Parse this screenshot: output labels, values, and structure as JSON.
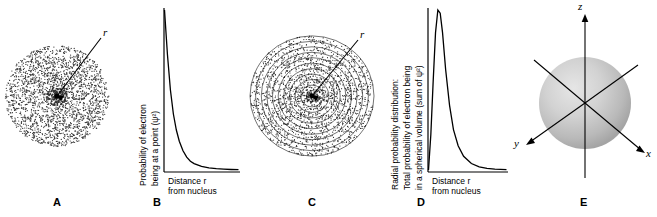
{
  "figure": {
    "panels": [
      {
        "id": "A",
        "letter": "A",
        "type": "electron-cloud-dot-density",
        "annotations": {
          "radius_label": "r"
        }
      },
      {
        "id": "B",
        "letter": "B",
        "type": "decay-curve-plot",
        "axes": {
          "ylabel_lines": [
            "Probability of electron",
            "being at a point (ψ²)"
          ],
          "xlabel_lines": [
            "Distance r",
            "from nucleus"
          ]
        },
        "chart": {
          "type": "line",
          "x": [
            0,
            0.04,
            0.08,
            0.12,
            0.16,
            0.2,
            0.25,
            0.3,
            0.35,
            0.4,
            0.5,
            0.6,
            0.7,
            0.8,
            0.9,
            1.0
          ],
          "y": [
            1.0,
            0.72,
            0.5,
            0.35,
            0.25,
            0.18,
            0.12,
            0.08,
            0.055,
            0.04,
            0.022,
            0.013,
            0.008,
            0.005,
            0.003,
            0.002
          ]
        }
      },
      {
        "id": "C",
        "letter": "C",
        "type": "concentric-shells-dot-density",
        "annotations": {
          "radius_label": "r"
        },
        "shell_count": 11
      },
      {
        "id": "D",
        "letter": "D",
        "type": "radial-probability-plot",
        "axes": {
          "ylabel_lines": [
            "Radial probability distribution:",
            "Total probability of electron being",
            "in a spherical volume (sum of ψ²)"
          ],
          "xlabel_lines": [
            "Distance r",
            "from nucleus"
          ]
        },
        "chart": {
          "type": "line",
          "x": [
            0,
            0.03,
            0.06,
            0.09,
            0.12,
            0.15,
            0.18,
            0.22,
            0.27,
            0.32,
            0.38,
            0.45,
            0.55,
            0.65,
            0.75,
            0.85,
            1.0
          ],
          "y": [
            0.0,
            0.22,
            0.55,
            0.85,
            0.99,
            0.97,
            0.85,
            0.62,
            0.4,
            0.25,
            0.15,
            0.085,
            0.04,
            0.02,
            0.01,
            0.005,
            0.002
          ]
        }
      },
      {
        "id": "E",
        "letter": "E",
        "type": "3d-sphere-orbital",
        "axis_labels": {
          "z": "z",
          "y": "y",
          "x": "x"
        }
      }
    ]
  },
  "colors": {
    "ink": "#000000",
    "background": "#ffffff",
    "sphere_light": "#dcdcdc",
    "sphere_mid": "#c2c2c2",
    "sphere_dark": "#a8a8a8"
  }
}
